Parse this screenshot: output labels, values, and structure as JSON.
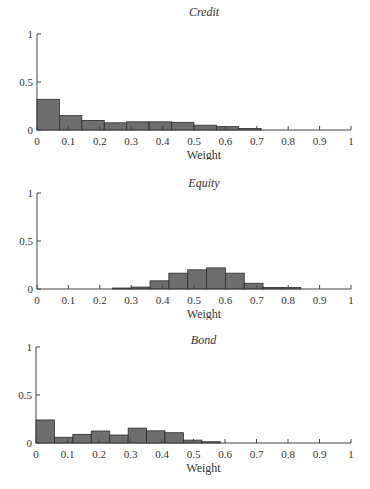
{
  "chart_data": [
    {
      "type": "bar",
      "title": "Credit",
      "xlabel": "Weight",
      "ylabel": "",
      "xlim": [
        0,
        1
      ],
      "ylim": [
        0,
        1
      ],
      "xticks": [
        "0",
        "0.1",
        "0.2",
        "0.3",
        "0.4",
        "0.5",
        "0.6",
        "0.7",
        "0.8",
        "0.9",
        "1"
      ],
      "yticks": [
        "0",
        "0.5",
        "1"
      ],
      "bin_width": 0.0714,
      "bin_start": 0,
      "values": [
        0.32,
        0.15,
        0.1,
        0.075,
        0.085,
        0.085,
        0.08,
        0.05,
        0.035,
        0.015
      ],
      "grid": false
    },
    {
      "type": "bar",
      "title": "Equity",
      "xlabel": "Weight",
      "ylabel": "",
      "xlim": [
        0,
        1
      ],
      "ylim": [
        0,
        1
      ],
      "xticks": [
        "0",
        "0.1",
        "0.2",
        "0.3",
        "0.4",
        "0.5",
        "0.6",
        "0.7",
        "0.8",
        "0.9",
        "1"
      ],
      "yticks": [
        "0",
        "0.5",
        "1"
      ],
      "bin_width": 0.06,
      "bin_start": 0.24,
      "values": [
        0.01,
        0.02,
        0.085,
        0.165,
        0.2,
        0.22,
        0.165,
        0.06,
        0.015,
        0.015
      ],
      "grid": false
    },
    {
      "type": "bar",
      "title": "Bond",
      "xlabel": "Weight",
      "ylabel": "",
      "xlim": [
        0,
        1
      ],
      "ylim": [
        0,
        1
      ],
      "xticks": [
        "0",
        "0.1",
        "0.2",
        "0.3",
        "0.4",
        "0.5",
        "0.6",
        "0.7",
        "0.8",
        "0.9",
        "1"
      ],
      "yticks": [
        "0",
        "0.5",
        "1"
      ],
      "bin_width": 0.0585,
      "bin_start": 0,
      "values": [
        0.24,
        0.06,
        0.09,
        0.125,
        0.083,
        0.155,
        0.127,
        0.107,
        0.03,
        0.013
      ],
      "grid": false
    }
  ],
  "panels": [
    {
      "title": "Credit",
      "xlabel": "Weight"
    },
    {
      "title": "Equity",
      "xlabel": "Weight"
    },
    {
      "title": "Bond",
      "xlabel": "Weight"
    }
  ]
}
